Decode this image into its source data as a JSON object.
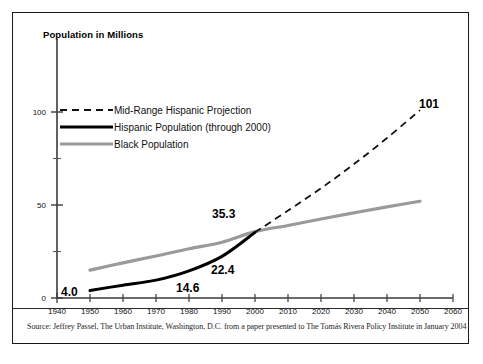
{
  "figure": {
    "title": "Population in Millions",
    "source_note": "Source:  Jeffrey Passel, The Urban Institute, Washington, D.C. from a paper presented to The Tomás Rivera Policy Institute in January 2004"
  },
  "chart_data": {
    "type": "line",
    "title": "Population in Millions",
    "xlabel": "",
    "ylabel": "Population in Millions",
    "xlim": [
      1940,
      2060
    ],
    "ylim": [
      0,
      115
    ],
    "xticks": [
      1940,
      1950,
      1960,
      1970,
      1980,
      1990,
      2000,
      2010,
      2020,
      2030,
      2040,
      2050,
      2060
    ],
    "yticks": [
      0,
      50,
      100
    ],
    "yticks_minor": [
      25,
      75
    ],
    "grid": false,
    "legend_position": "upper-left-inside",
    "series": [
      {
        "name": "Mid-Range Hispanic Projection",
        "style": "dashed",
        "color": "#111111",
        "x": [
          2000,
          2010,
          2020,
          2030,
          2040,
          2050
        ],
        "values": [
          35.3,
          47.0,
          59.0,
          72.0,
          86.0,
          101.0
        ]
      },
      {
        "name": "Hispanic Population (through 2000)",
        "style": "solid",
        "color": "#000000",
        "x": [
          1950,
          1960,
          1970,
          1980,
          1990,
          2000
        ],
        "values": [
          4.0,
          6.9,
          9.6,
          14.6,
          22.4,
          35.3
        ]
      },
      {
        "name": "Black Population",
        "style": "solid",
        "color": "#9a9a9a",
        "x": [
          1950,
          1960,
          1970,
          1980,
          1990,
          2000,
          2010,
          2020,
          2030,
          2040,
          2050
        ],
        "values": [
          15.0,
          18.9,
          22.6,
          26.5,
          30.0,
          35.7,
          39.0,
          42.5,
          45.8,
          49.0,
          52.0
        ]
      }
    ],
    "annotations": [
      {
        "text": "4.0",
        "x": 1950,
        "y": 4.0
      },
      {
        "text": "14.6",
        "x": 1980,
        "y": 14.6
      },
      {
        "text": "22.4",
        "x": 1990,
        "y": 22.4
      },
      {
        "text": "35.3",
        "x": 2000,
        "y": 35.3
      },
      {
        "text": "101",
        "x": 2050,
        "y": 101
      }
    ]
  },
  "axes": {
    "x_tick_labels": [
      "1940",
      "1950",
      "1960",
      "1970",
      "1980",
      "1990",
      "2000",
      "2010",
      "2020",
      "2030",
      "2040",
      "2050",
      "2060"
    ],
    "y_tick_labels": [
      "0",
      "50",
      "100"
    ]
  },
  "legend": {
    "items": [
      {
        "label": "Mid-Range Hispanic Projection",
        "key": "dashed-black-line"
      },
      {
        "label": "Hispanic Population (through 2000)",
        "key": "solid-black-line"
      },
      {
        "label": "Black Population",
        "key": "solid-gray-line"
      }
    ]
  }
}
